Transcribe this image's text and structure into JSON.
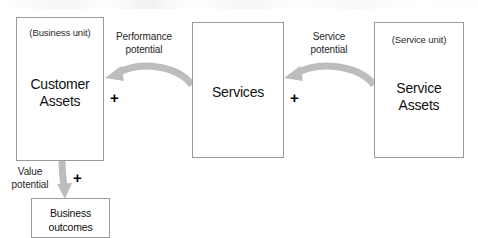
{
  "diagram": {
    "type": "service-value-chain",
    "arrow_color": "#b9b9b9",
    "box_border_color": "#9a9a9a",
    "text_color": "#1a1a1a",
    "boxes": [
      {
        "id": "customer-assets",
        "subtitle": "(Business unit)",
        "title_line1": "Customer",
        "title_line2": "Assets"
      },
      {
        "id": "services",
        "subtitle": "",
        "title_line1": "Services",
        "title_line2": ""
      },
      {
        "id": "service-assets",
        "subtitle": "(Service unit)",
        "title_line1": "Service",
        "title_line2": "Assets"
      },
      {
        "id": "business-outcomes",
        "subtitle": "",
        "title_line1": "Business",
        "title_line2": "outcomes"
      }
    ],
    "connectors": [
      {
        "id": "performance-potential",
        "label_line1": "Performance",
        "label_line2": "potential",
        "operator": "+",
        "direction": "right-to-left"
      },
      {
        "id": "service-potential",
        "label_line1": "Service",
        "label_line2": "potential",
        "operator": "+",
        "direction": "right-to-left"
      },
      {
        "id": "value-potential",
        "label_line1": "Value",
        "label_line2": "potential",
        "operator": "+",
        "direction": "top-to-bottom"
      }
    ]
  }
}
